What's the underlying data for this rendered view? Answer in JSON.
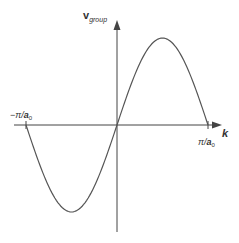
{
  "chart_data": {
    "type": "line",
    "title": "",
    "xlabel": "k",
    "ylabel": "v_group",
    "x_ticks": [
      "-π/a0",
      "π/a0"
    ],
    "xlim": [
      -1.0,
      1.0
    ],
    "ylim": [
      -1.0,
      1.0
    ],
    "grid": false,
    "legend": null,
    "series": [
      {
        "name": "v_group(k)",
        "description": "sin(k·a0) over one Brillouin zone; zero at -π/a0, 0, π/a0; max at k≈π/(2a0), min at k≈-π/(2a0)",
        "x": [
          -1.0,
          -0.75,
          -0.5,
          -0.25,
          0.0,
          0.25,
          0.5,
          0.75,
          1.0
        ],
        "y": [
          0.0,
          -0.71,
          -1.0,
          -0.71,
          0.0,
          0.71,
          1.0,
          0.71,
          0.0
        ]
      }
    ]
  },
  "labels": {
    "y_axis": {
      "main": "v",
      "sub": "group"
    },
    "x_axis": "k",
    "tick_neg": {
      "prefix": "−π/",
      "var": "a",
      "sub": "0"
    },
    "tick_pos": {
      "prefix": "π/",
      "var": "a",
      "sub": "0"
    }
  },
  "colors": {
    "axis": "#444444",
    "curve": "#555555",
    "text": "#333333",
    "background": "#ffffff"
  }
}
